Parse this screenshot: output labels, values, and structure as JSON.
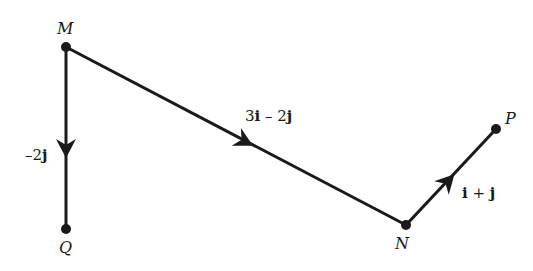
{
  "diagram": {
    "title": "",
    "points": [
      {
        "id": "M",
        "label": "M"
      },
      {
        "id": "Q",
        "label": "Q"
      },
      {
        "id": "N",
        "label": "N"
      },
      {
        "id": "P",
        "label": "P"
      }
    ],
    "vectors": [
      {
        "from": "M",
        "to": "Q",
        "label_parts": [
          "–2",
          "j"
        ],
        "label": "–2j"
      },
      {
        "from": "M",
        "to": "N",
        "label_parts": [
          "3",
          "i",
          " – 2",
          "j"
        ],
        "label": "3i – 2j"
      },
      {
        "from": "N",
        "to": "P",
        "label_parts": [
          "i",
          " + ",
          "j"
        ],
        "label": "i + j"
      }
    ],
    "colors": {
      "line": "#1a1a1a",
      "background": "#ffffff"
    }
  }
}
